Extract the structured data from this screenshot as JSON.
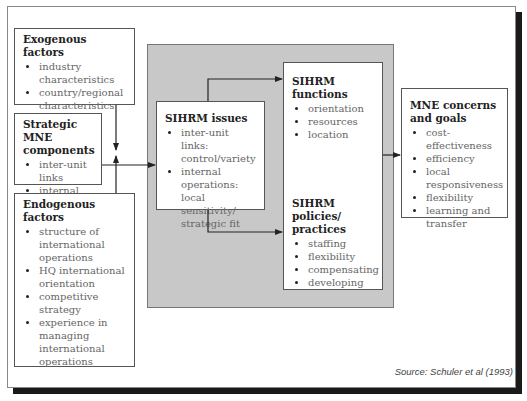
{
  "exogenous": {
    "title": "Exogenous factors",
    "items": [
      "industry characteristics",
      "country/regional characteristics"
    ]
  },
  "strategic": {
    "title": "Strategic MNE components",
    "items": [
      "inter-unit links",
      "internal operations"
    ]
  },
  "endogenous": {
    "title": "Endogenous factors",
    "items": [
      "structure of international operations",
      "HQ international orientation",
      "competitive strategy",
      "experience in managing international operations"
    ]
  },
  "issues": {
    "title": "SIHRM issues",
    "items": [
      "inter-unit links: control/variety",
      "internal operations: local sensitivity/ strategic fit"
    ]
  },
  "functions": {
    "title": "SIHRM functions",
    "items": [
      "orientation",
      "resources",
      "location"
    ]
  },
  "policies": {
    "title": "SIHRM policies/ practices",
    "items": [
      "staffing",
      "flexibility",
      "compensating",
      "developing"
    ]
  },
  "goals": {
    "title": "MNE concerns and goals",
    "items": [
      "cost-effectiveness",
      "efficiency",
      "local responsiveness",
      "flexibility",
      "learning and transfer"
    ]
  },
  "source": "Source: Schuler et al (1993)"
}
